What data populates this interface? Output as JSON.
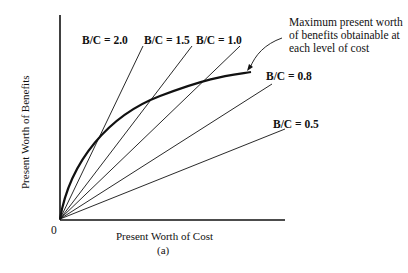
{
  "figure": {
    "y_axis_label": "Present Worth of Benefits",
    "x_axis_label": "Present Worth of Cost",
    "origin_label": "0",
    "caption": "(a)",
    "annotation": {
      "line1": "Maximum present worth",
      "line2": "of benefits obtainable at",
      "line3": "each level of cost"
    },
    "ratio_lines": [
      {
        "label": "B/C = 2.0",
        "x2": 143,
        "y2": 46,
        "lx": 82,
        "ly": 44
      },
      {
        "label": "B/C = 1.5",
        "x2": 192,
        "y2": 46,
        "lx": 144,
        "ly": 44
      },
      {
        "label": "B/C = 1.0",
        "x2": 240,
        "y2": 46,
        "lx": 196,
        "ly": 44
      },
      {
        "label": "B/C = 0.8",
        "x2": 272,
        "y2": 84,
        "lx": 266,
        "ly": 80
      },
      {
        "label": "B/C = 0.5",
        "x2": 285,
        "y2": 129,
        "lx": 273,
        "ly": 128
      }
    ],
    "colors": {
      "ink": "#111111",
      "background": "#ffffff"
    }
  },
  "chart_data": {
    "type": "line",
    "title": "",
    "xlabel": "Present Worth of Cost",
    "ylabel": "Present Worth of Benefits",
    "series": [
      {
        "name": "B/C = 2.0",
        "kind": "ray",
        "slope": 2.0
      },
      {
        "name": "B/C = 1.5",
        "kind": "ray",
        "slope": 1.5
      },
      {
        "name": "B/C = 1.0",
        "kind": "ray",
        "slope": 1.0
      },
      {
        "name": "B/C = 0.8",
        "kind": "ray",
        "slope": 0.8
      },
      {
        "name": "B/C = 0.5",
        "kind": "ray",
        "slope": 0.5
      },
      {
        "name": "Maximum present worth of benefits obtainable at each level of cost",
        "kind": "concave curve"
      }
    ],
    "annotations": [
      "Maximum present worth of benefits obtainable at each level of cost",
      "(a)"
    ],
    "grid": false
  }
}
